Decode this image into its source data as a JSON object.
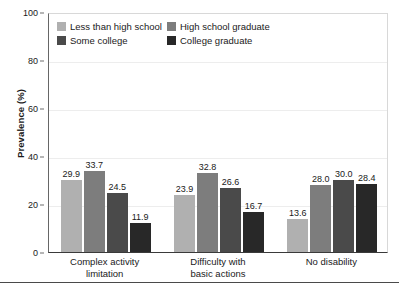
{
  "chart_data": {
    "type": "bar",
    "title": "",
    "xlabel": "",
    "ylabel": "Prevalence (%)",
    "ylim": [
      0,
      100
    ],
    "yticks": [
      0,
      20,
      40,
      60,
      80,
      100
    ],
    "grid": true,
    "legend_position": "top-left-inside",
    "categories": [
      "Complex activity limitation",
      "Difficulty with basic actions",
      "No disability"
    ],
    "category_lines": [
      [
        "Complex activity",
        "limitation"
      ],
      [
        "Difficulty with",
        "basic actions"
      ],
      [
        "No disability",
        ""
      ]
    ],
    "series": [
      {
        "name": "Less than high school",
        "color": "#b0b0b0",
        "values": [
          29.9,
          23.9,
          13.6
        ],
        "labels": [
          "29.9",
          "23.9",
          "13.6"
        ]
      },
      {
        "name": "High school graduate",
        "color": "#7d7d7d",
        "values": [
          33.7,
          32.8,
          28.0
        ],
        "labels": [
          "33.7",
          "32.8",
          "28.0"
        ]
      },
      {
        "name": "Some college",
        "color": "#4a4a4a",
        "values": [
          24.5,
          26.6,
          30.0
        ],
        "labels": [
          "24.5",
          "26.6",
          "30.0"
        ]
      },
      {
        "name": "College graduate",
        "color": "#282828",
        "values": [
          11.9,
          16.7,
          28.4
        ],
        "labels": [
          "11.9",
          "16.7",
          "28.4"
        ]
      }
    ]
  },
  "axis": {
    "y_title": "Prevalence (%)",
    "y_tick_labels": [
      "100",
      "80",
      "60",
      "40",
      "20",
      "0"
    ]
  },
  "legend": {
    "items": [
      {
        "label": "Less than high school",
        "color": "#b0b0b0"
      },
      {
        "label": "High school graduate",
        "color": "#7d7d7d"
      },
      {
        "label": "Some college",
        "color": "#4a4a4a"
      },
      {
        "label": "College graduate",
        "color": "#282828"
      }
    ]
  }
}
